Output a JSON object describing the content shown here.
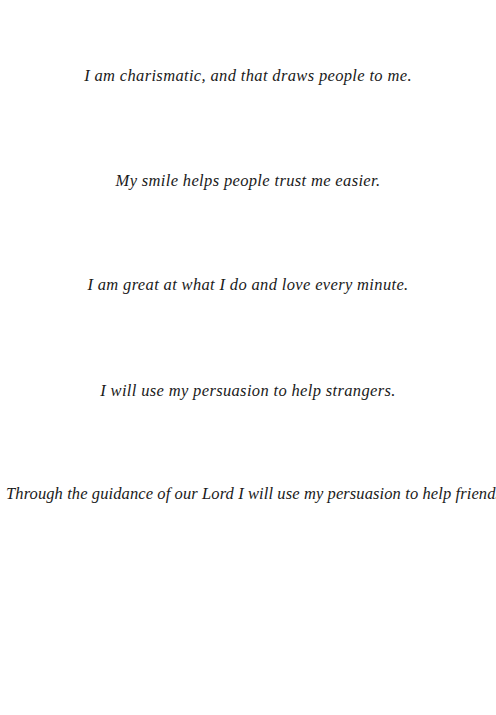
{
  "page": {
    "background_color": "#ffffff",
    "text_color": "#1a1a1a",
    "lines": [
      {
        "text": "I am charismatic, and that draws people to me."
      },
      {
        "text": "My smile helps people trust me easier."
      },
      {
        "text": "I am great at what I do and love every minute."
      },
      {
        "text": "I will use my persuasion to help strangers."
      },
      {
        "text": "Through the guidance of our Lord I will use my persuasion to help friends."
      }
    ]
  }
}
